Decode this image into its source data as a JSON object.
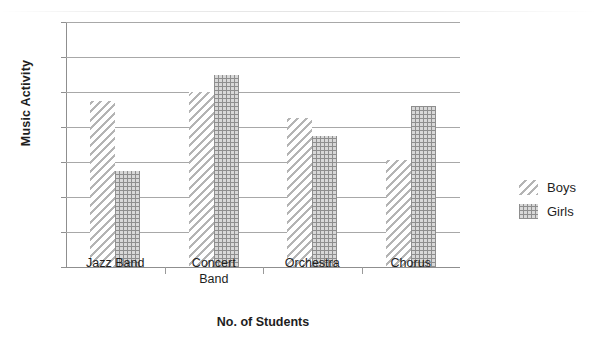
{
  "chart_data": {
    "type": "bar",
    "title": "",
    "subtitle": "",
    "xlabel": "No. of Students",
    "ylabel": "Music Activity",
    "categories": [
      "Jazz Band",
      "Concert Band",
      "Orchestra",
      "Chorus"
    ],
    "category_lines": [
      [
        "Jazz Band"
      ],
      [
        "Concert",
        "Band"
      ],
      [
        "Orchestra"
      ],
      [
        "Chorus"
      ]
    ],
    "series": [
      {
        "name": "Boys",
        "values": [
          19,
          20,
          17,
          12.2
        ],
        "pattern": "diagonal-hatch",
        "color": "#b4b4b4"
      },
      {
        "name": "Girls",
        "values": [
          11,
          22,
          15,
          18.4
        ],
        "pattern": "dotted-grid",
        "color": "#8e8e8e"
      }
    ],
    "ylim": [
      0,
      28
    ],
    "ytick_step": 4,
    "yticks": [
      0,
      4,
      8,
      12,
      16,
      20,
      24,
      28
    ],
    "grid": true,
    "grid_axis": "y",
    "legend_position": "right"
  },
  "axes": {
    "y_title": "Music Activity",
    "x_title": "No. of Students"
  },
  "legend": {
    "entries": [
      {
        "label": "Boys"
      },
      {
        "label": "Girls"
      }
    ]
  }
}
